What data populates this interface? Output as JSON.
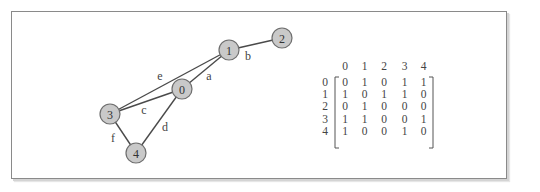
{
  "graph": {
    "nodes": [
      {
        "id": "0",
        "x": 182,
        "y": 89
      },
      {
        "id": "1",
        "x": 229,
        "y": 50
      },
      {
        "id": "2",
        "x": 282,
        "y": 38
      },
      {
        "id": "3",
        "x": 110,
        "y": 114
      },
      {
        "id": "4",
        "x": 136,
        "y": 153
      }
    ],
    "node_radius": 10,
    "edges": [
      {
        "label": "a",
        "from": "0",
        "to": "1",
        "label_x": 209,
        "label_y": 76
      },
      {
        "label": "b",
        "from": "1",
        "to": "2",
        "label_x": 248,
        "label_y": 56
      },
      {
        "label": "c",
        "from": "3",
        "to": "0",
        "label_x": 144,
        "label_y": 110
      },
      {
        "label": "d",
        "from": "0",
        "to": "4",
        "label_x": 165,
        "label_y": 127
      },
      {
        "label": "e",
        "from": "3",
        "to": "1",
        "label_x": 160,
        "label_y": 76
      },
      {
        "label": "f",
        "from": "3",
        "to": "4",
        "label_x": 113,
        "label_y": 138
      }
    ],
    "colors": {
      "node_fill": "#c9c9c9",
      "node_stroke": "#6e6e6e",
      "edge": "#4a4a4a"
    }
  },
  "matrix": {
    "column_headers": [
      "0",
      "1",
      "2",
      "3",
      "4"
    ],
    "row_headers": [
      "0",
      "1",
      "2",
      "3",
      "4"
    ],
    "rows": [
      [
        "0",
        "1",
        "0",
        "1",
        "1"
      ],
      [
        "1",
        "0",
        "1",
        "1",
        "0"
      ],
      [
        "0",
        "1",
        "0",
        "0",
        "0"
      ],
      [
        "1",
        "1",
        "0",
        "0",
        "1"
      ],
      [
        "1",
        "0",
        "0",
        "1",
        "0"
      ]
    ]
  }
}
